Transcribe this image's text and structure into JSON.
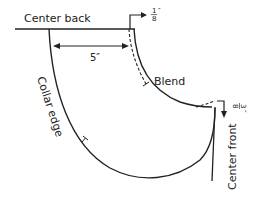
{
  "diagram": {
    "type": "pattern-drafting",
    "labels": {
      "center_back": "Center back",
      "center_front": "Center front",
      "collar_edge": "Collar edge",
      "blend": "Blend",
      "width_measure": "5″",
      "top_adjust_num": "1",
      "top_adjust_den": "8",
      "top_adjust_unit": "″",
      "front_adjust_num": "3",
      "front_adjust_den": "8",
      "front_adjust_unit": "″"
    },
    "colors": {
      "line": "#222222",
      "background": "#ffffff"
    }
  }
}
